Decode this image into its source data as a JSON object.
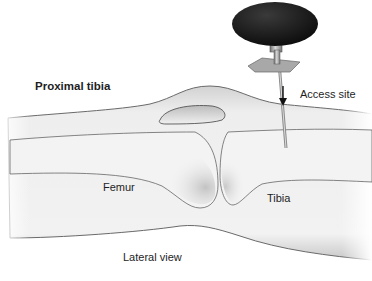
{
  "figure": {
    "title": "Proximal tibia",
    "view_label": "Lateral view",
    "labels": {
      "access_site": "Access site",
      "femur": "Femur",
      "tibia": "Tibia"
    },
    "icons": {
      "needle": "intraosseous-needle-icon",
      "arrow": "down-arrow-icon"
    },
    "colors": {
      "background": "#ffffff",
      "skin": "#e8e8e8",
      "bone": "#f4f4f4",
      "outline": "#5a5a5a",
      "handle": "#1c1c1c",
      "metal": "#9a9a9a",
      "text": "#1e1e1e"
    }
  }
}
